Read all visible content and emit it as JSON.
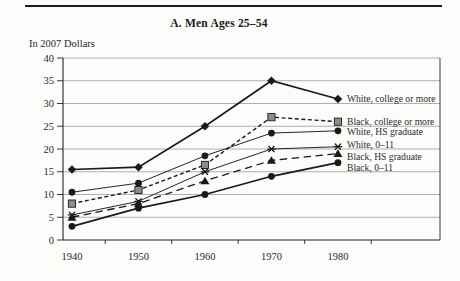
{
  "header": {
    "title": "A. Men Ages 25–54",
    "units_label": "In 2007 Dollars"
  },
  "chart_data": {
    "type": "line",
    "title": "A. Men Ages 25–54",
    "ylabel": "In 2007 Dollars",
    "xlabel": "",
    "x": [
      1940,
      1950,
      1960,
      1970,
      1980
    ],
    "x_tick_labels": [
      "1940",
      "1950",
      "1960",
      "1970",
      "1980"
    ],
    "x_minor_ticks": [
      1945,
      1955,
      1965,
      1975,
      1985
    ],
    "xlim": [
      1938.65,
      1995.35
    ],
    "ylim": [
      0,
      40
    ],
    "y_ticks": [
      0,
      5,
      10,
      15,
      20,
      25,
      30,
      35,
      40
    ],
    "grid": true,
    "legend_position": "right-of-line-ends",
    "series": [
      {
        "name": "White, college or more",
        "marker": "diamond",
        "line": "solid-thick",
        "values": [
          15.5,
          16,
          25,
          35,
          31
        ]
      },
      {
        "name": "Black, college or more",
        "marker": "square",
        "line": "short-dash",
        "values": [
          8,
          11,
          16.5,
          27,
          26
        ]
      },
      {
        "name": "White, HS graduate",
        "marker": "circle",
        "line": "solid-thin",
        "values": [
          10.5,
          12.5,
          18.5,
          23.5,
          24
        ]
      },
      {
        "name": "White, 0–11",
        "marker": "asterisk",
        "line": "solid-thin",
        "values": [
          5.5,
          8.5,
          15,
          20,
          20.5
        ]
      },
      {
        "name": "Black, HS graduate",
        "marker": "triangle",
        "line": "long-dash",
        "values": [
          5,
          8,
          13,
          17.5,
          19
        ]
      },
      {
        "name": "Black, 0–11",
        "marker": "circle",
        "line": "solid-thick",
        "values": [
          3,
          7,
          10,
          14,
          17
        ]
      }
    ],
    "colors": {
      "line": "#1a1a1a",
      "grid": "#6e6e6e",
      "axis": "#222222",
      "text": "#2b2b2b",
      "square_fill": "#8c8c8c",
      "background": "#fcfcfa"
    }
  }
}
